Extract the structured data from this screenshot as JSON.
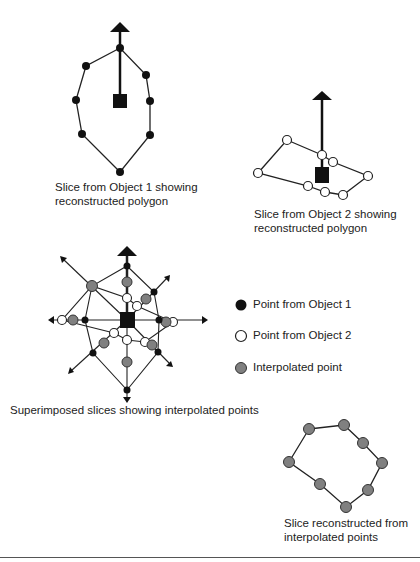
{
  "captions": {
    "object1_line1": "Slice from Object 1 showing",
    "object1_line2": "reconstructed polygon",
    "object2_line1": "Slice from Object 2 showing",
    "object2_line2": "reconstructed polygon",
    "superimposed": "Superimposed slices showing interpolated points",
    "reconstructed_line1": "Slice reconstructed from",
    "reconstructed_line2": "interpolated points"
  },
  "legend": {
    "items": [
      {
        "label": "Point from Object 1",
        "color": "#111111",
        "icon": "black-filled-circle"
      },
      {
        "label": "Point from Object 2",
        "color": "#ffffff",
        "icon": "white-hollow-circle"
      },
      {
        "label": "Interpolated point",
        "color": "#808080",
        "icon": "gray-filled-circle"
      }
    ]
  },
  "colors": {
    "object1_point": "#111111",
    "object2_point": "#ffffff",
    "interpolated_point": "#808080",
    "line": "#222222",
    "centroid": "#111111"
  }
}
